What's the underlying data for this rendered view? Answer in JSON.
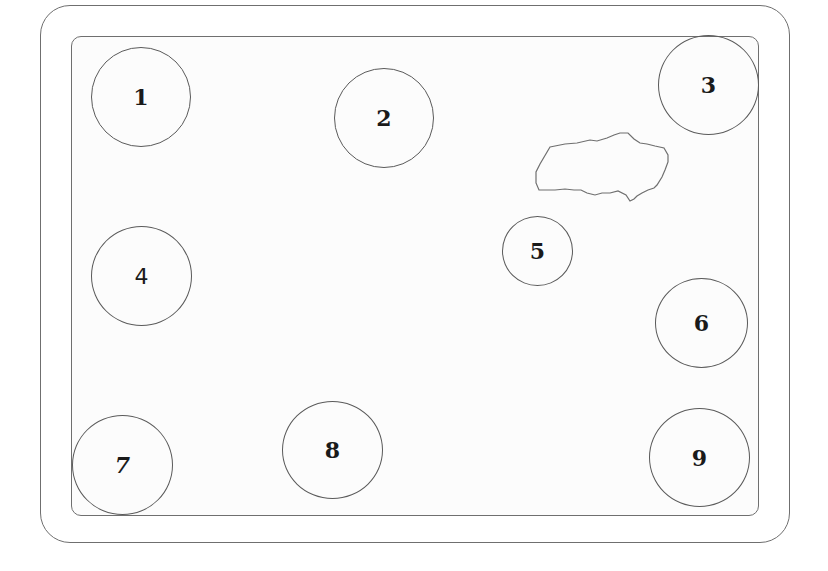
{
  "diagram": {
    "frame": {
      "outer_border_color": "#6f6f6f",
      "inner_border_color": "#6f6f6f"
    },
    "circles": [
      {
        "label": "1",
        "cx": 141,
        "cy": 97,
        "r": 50
      },
      {
        "label": "2",
        "cx": 384,
        "cy": 118,
        "r": 50
      },
      {
        "label": "3",
        "cx": 708,
        "cy": 85,
        "r": 50
      },
      {
        "label": "4",
        "cx": 141,
        "cy": 276,
        "r": 50
      },
      {
        "label": "5",
        "cx": 537,
        "cy": 251,
        "r": 35
      },
      {
        "label": "6",
        "cx": 701,
        "cy": 323,
        "r": 45
      },
      {
        "label": "7",
        "cx": 122,
        "cy": 465,
        "r": 50
      },
      {
        "label": "8",
        "cx": 332,
        "cy": 450,
        "r": 50
      },
      {
        "label": "9",
        "cx": 699,
        "cy": 457,
        "r": 50
      }
    ],
    "obstacle": {
      "name": "irregular-blob",
      "color": "#6f6f6f"
    }
  }
}
